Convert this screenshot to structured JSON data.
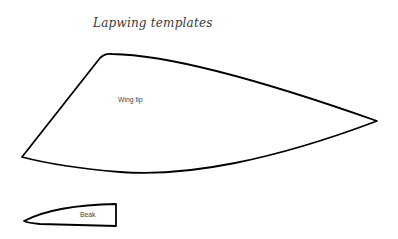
{
  "title": "Lapwing templates",
  "templates": [
    {
      "name": "wing-tip",
      "label": "Wing tip"
    },
    {
      "name": "beak",
      "label": "Beak"
    }
  ],
  "colors": {
    "outline": "#000000",
    "background": "#ffffff",
    "text": "#444444"
  }
}
